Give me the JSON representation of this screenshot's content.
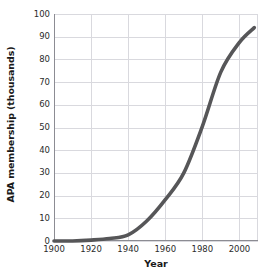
{
  "chart_data": {
    "type": "line",
    "title": "",
    "xlabel": "Year",
    "ylabel": "APA membership (thousands)",
    "xlim": [
      1900,
      2010
    ],
    "ylim": [
      0,
      100
    ],
    "grid": true,
    "legend": "none",
    "line_color": "#565658",
    "grid_color": "#d9d9de",
    "axis_color": "#8c8c93",
    "xticks": [
      1900,
      1920,
      1940,
      1960,
      1980,
      2000
    ],
    "xtick_labels": [
      "1900",
      "1920",
      "1940",
      "1960",
      "1980",
      "2000"
    ],
    "yticks": [
      0,
      10,
      20,
      30,
      40,
      50,
      60,
      70,
      80,
      90,
      100
    ],
    "ytick_labels": [
      "0",
      "10",
      "20",
      "30",
      "40",
      "50",
      "60",
      "70",
      "80",
      "90",
      "100"
    ],
    "x": [
      1900,
      1910,
      1920,
      1930,
      1940,
      1950,
      1960,
      1970,
      1980,
      1990,
      2000,
      2008
    ],
    "values": [
      0,
      0,
      0.4,
      1.1,
      2.7,
      8.8,
      18.2,
      30.0,
      50.5,
      74.5,
      87.5,
      94.0
    ],
    "series": [
      {
        "name": "APA membership",
        "values": [
          0,
          0,
          0.4,
          1.1,
          2.7,
          8.8,
          18.2,
          30.0,
          50.5,
          74.5,
          87.5,
          94.0
        ]
      }
    ]
  }
}
